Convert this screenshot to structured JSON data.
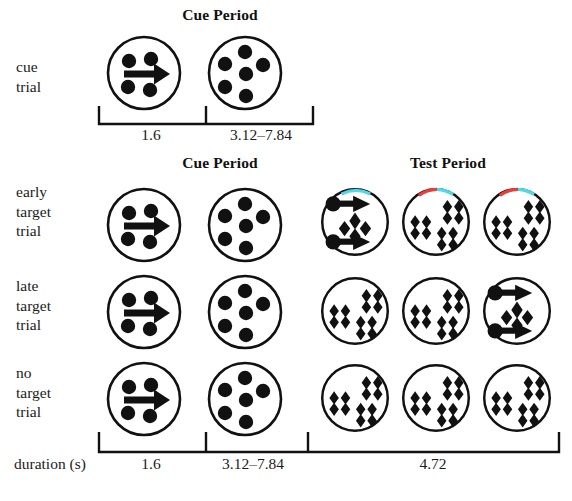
{
  "figure": {
    "type": "experimental-trial-schematic",
    "background": "#ffffff",
    "stroke_color": "#111111",
    "width": 572,
    "height": 501
  },
  "headers": {
    "top_cue_period": "Cue Period",
    "mid_cue_period": "Cue Period",
    "mid_test_period": "Test Period"
  },
  "rows": [
    {
      "id": "cue-trial",
      "label_lines": [
        "cue",
        "trial"
      ],
      "stimuli": [
        {
          "phase": "cue",
          "kind": "dots-with-arrow",
          "dot_count": 4,
          "arrow": "right",
          "arrow_count": 1,
          "arc_colors": []
        },
        {
          "phase": "delay",
          "kind": "dots",
          "dot_count": 6,
          "arrow": "none",
          "arrow_count": 0,
          "arc_colors": []
        }
      ]
    },
    {
      "id": "early-target-trial",
      "label_lines": [
        "early",
        "target",
        "trial"
      ],
      "stimuli": [
        {
          "phase": "cue",
          "kind": "dots-with-arrow",
          "dot_count": 4,
          "arrow": "right",
          "arrow_count": 1,
          "arc_colors": []
        },
        {
          "phase": "delay",
          "kind": "dots",
          "dot_count": 6,
          "arrow": "none",
          "arrow_count": 0,
          "arc_colors": []
        },
        {
          "phase": "test",
          "kind": "diamonds-with-arrows",
          "cluster_count": 1,
          "arrow": "right",
          "arrow_count": 2,
          "arc_colors": [
            "cyan"
          ]
        },
        {
          "phase": "test",
          "kind": "diamonds",
          "cluster_count": 3,
          "arrow": "none",
          "arrow_count": 0,
          "arc_colors": [
            "red",
            "cyan"
          ]
        },
        {
          "phase": "test",
          "kind": "diamonds",
          "cluster_count": 3,
          "arrow": "none",
          "arrow_count": 0,
          "arc_colors": [
            "red",
            "cyan"
          ]
        }
      ]
    },
    {
      "id": "late-target-trial",
      "label_lines": [
        "late",
        "target",
        "trial"
      ],
      "stimuli": [
        {
          "phase": "cue",
          "kind": "dots-with-arrow",
          "dot_count": 4,
          "arrow": "right",
          "arrow_count": 1,
          "arc_colors": []
        },
        {
          "phase": "delay",
          "kind": "dots",
          "dot_count": 6,
          "arrow": "none",
          "arrow_count": 0,
          "arc_colors": []
        },
        {
          "phase": "test",
          "kind": "diamonds",
          "cluster_count": 3,
          "arrow": "none",
          "arrow_count": 0,
          "arc_colors": []
        },
        {
          "phase": "test",
          "kind": "diamonds",
          "cluster_count": 3,
          "arrow": "none",
          "arrow_count": 0,
          "arc_colors": []
        },
        {
          "phase": "test",
          "kind": "diamonds-with-arrows",
          "cluster_count": 1,
          "arrow": "right",
          "arrow_count": 2,
          "arc_colors": []
        }
      ]
    },
    {
      "id": "no-target-trial",
      "label_lines": [
        "no",
        "target",
        "trial"
      ],
      "stimuli": [
        {
          "phase": "cue",
          "kind": "dots-with-arrow",
          "dot_count": 4,
          "arrow": "right",
          "arrow_count": 1,
          "arc_colors": []
        },
        {
          "phase": "delay",
          "kind": "dots",
          "dot_count": 6,
          "arrow": "none",
          "arrow_count": 0,
          "arc_colors": []
        },
        {
          "phase": "test",
          "kind": "diamonds",
          "cluster_count": 3,
          "arrow": "none",
          "arrow_count": 0,
          "arc_colors": []
        },
        {
          "phase": "test",
          "kind": "diamonds",
          "cluster_count": 3,
          "arrow": "none",
          "arrow_count": 0,
          "arc_colors": []
        },
        {
          "phase": "test",
          "kind": "diamonds",
          "cluster_count": 3,
          "arrow": "none",
          "arrow_count": 0,
          "arc_colors": []
        }
      ]
    }
  ],
  "top_timeline": {
    "segments": [
      {
        "label": "1.6"
      },
      {
        "label": "3.12–7.84"
      }
    ]
  },
  "bottom_timeline": {
    "axis_label": "duration (s)",
    "segments": [
      {
        "label": "1.6"
      },
      {
        "label": "3.12–7.84"
      },
      {
        "label": "4.72"
      }
    ]
  },
  "colors": {
    "arc_cyan": "#4fd8e8",
    "arc_red": "#ef3b3b",
    "ink": "#111111"
  }
}
